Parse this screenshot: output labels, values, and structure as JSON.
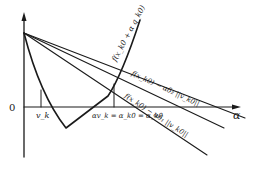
{
  "figure": {
    "type": "line-search diagram (Armijo / sufficient decrease condition)",
    "axes": {
      "x_label": "α",
      "origin_label": "0"
    },
    "labels": {
      "curve": "f(x_k0 + α q_k0)",
      "upper_line": "f(x_k0) − αδ₂ ||v_k0||",
      "lower_line": "f(x_k0) − αδ₁ ||v_k0||",
      "tick_v": "v_k",
      "tick_alpha": "αv_k = α_k0 = α_k0"
    },
    "colors": {
      "ink": "#1a1a1a",
      "background": "#ffffff"
    }
  }
}
